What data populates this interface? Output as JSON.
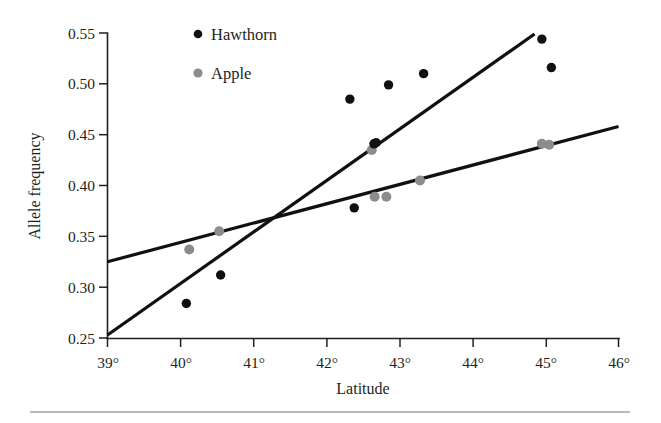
{
  "chart_data": {
    "type": "scatter",
    "title": "",
    "xlabel": "Latitude",
    "ylabel": "Allele frequency",
    "xlim": [
      39,
      46
    ],
    "ylim": [
      0.25,
      0.55
    ],
    "xticks": [
      39,
      40,
      41,
      42,
      43,
      44,
      45,
      46
    ],
    "xtick_labels": [
      "39°",
      "40°",
      "41°",
      "42°",
      "43°",
      "44°",
      "45°",
      "46°"
    ],
    "yticks": [
      0.25,
      0.3,
      0.35,
      0.4,
      0.45,
      0.5,
      0.55
    ],
    "ytick_labels": [
      "0.25",
      "0.30",
      "0.35",
      "0.40",
      "0.45",
      "0.50",
      "0.55"
    ],
    "grid": false,
    "legend_position": "top-left-inside",
    "series": [
      {
        "name": "Hawthorn",
        "color": "#111111",
        "marker": "circle",
        "points": [
          {
            "x": 40.08,
            "y": 0.284
          },
          {
            "x": 40.55,
            "y": 0.312
          },
          {
            "x": 42.32,
            "y": 0.485
          },
          {
            "x": 42.38,
            "y": 0.378
          },
          {
            "x": 42.65,
            "y": 0.441
          },
          {
            "x": 42.68,
            "y": 0.442
          },
          {
            "x": 42.85,
            "y": 0.499
          },
          {
            "x": 43.33,
            "y": 0.51
          },
          {
            "x": 44.95,
            "y": 0.544
          },
          {
            "x": 45.08,
            "y": 0.516
          }
        ],
        "fit_line": {
          "x1": 39.0,
          "y1": 0.253,
          "x2": 44.85,
          "y2": 0.549
        }
      },
      {
        "name": "Apple",
        "color": "#8c8c8c",
        "marker": "circle",
        "points": [
          {
            "x": 40.12,
            "y": 0.337
          },
          {
            "x": 40.53,
            "y": 0.355
          },
          {
            "x": 42.62,
            "y": 0.435
          },
          {
            "x": 42.66,
            "y": 0.389
          },
          {
            "x": 42.82,
            "y": 0.389
          },
          {
            "x": 43.28,
            "y": 0.405
          },
          {
            "x": 44.95,
            "y": 0.441
          },
          {
            "x": 45.05,
            "y": 0.44
          }
        ],
        "fit_line": {
          "x1": 39.0,
          "y1": 0.325,
          "x2": 46.0,
          "y2": 0.458
        }
      }
    ]
  },
  "legend": {
    "entries": [
      {
        "label": "Hawthorn",
        "color": "#111111",
        "marker_name": "legend-marker-hawthorn"
      },
      {
        "label": "Apple",
        "color": "#8c8c8c",
        "marker_name": "legend-marker-apple"
      }
    ]
  },
  "axes": {
    "y_title": "Allele frequency",
    "x_title": "Latitude"
  }
}
